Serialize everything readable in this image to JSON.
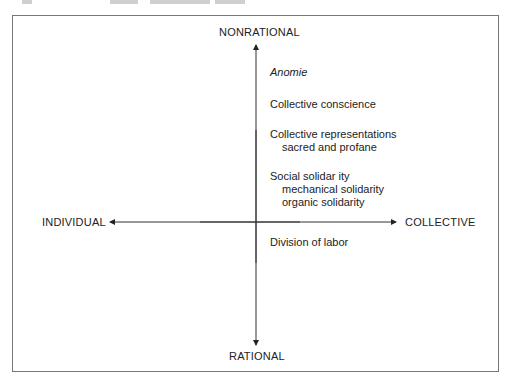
{
  "diagram": {
    "axes": {
      "top": "NONRATIONAL",
      "bottom": "RATIONAL",
      "left": "INDIVIDUAL",
      "right": "COLLECTIVE"
    },
    "concepts": [
      {
        "label": "Anomie",
        "italic": true,
        "subitems": []
      },
      {
        "label": "Collective conscience",
        "subitems": []
      },
      {
        "label": "Collective representations",
        "subitems": [
          "sacred and profane"
        ]
      },
      {
        "label": "Social solidar ity",
        "subitems": [
          "mechanical solidarity",
          "organic solidarity"
        ]
      },
      {
        "label": "Division of labor",
        "subitems": []
      }
    ]
  }
}
